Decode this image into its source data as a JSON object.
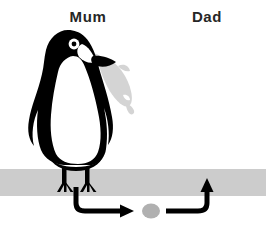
{
  "diagram": {
    "title_visible": false,
    "background_color": "#ffffff",
    "labels": [
      {
        "id": "mum",
        "text": "Mum",
        "x": 88,
        "y": 22,
        "color": "#262626"
      },
      {
        "id": "dad",
        "text": "Dad",
        "x": 207,
        "y": 22,
        "color": "#262626"
      }
    ],
    "ground": {
      "name": "ground-bar",
      "color": "#cccccc",
      "x": 0,
      "y": 169,
      "width": 266,
      "height": 27
    },
    "penguins": [
      {
        "id": "mum-penguin",
        "role": "Mum",
        "facing": "right",
        "body_color": "#000000",
        "belly_color": "#ffffff",
        "eye_color": "#ffffff",
        "holds_item": "fish"
      },
      {
        "id": "dad-penguin",
        "role": "Dad",
        "facing": "left",
        "body_color": "#000000",
        "belly_color": "#ffffff",
        "eye_color": "#ffffff",
        "holds_item": null
      }
    ],
    "fish": {
      "name": "fish",
      "color": "#d4d4d4",
      "held_by": "Mum",
      "description": "fish in beak"
    },
    "egg": {
      "name": "egg",
      "color": "#b0b0b0",
      "cx": 151,
      "cy": 211,
      "rx": 9,
      "ry": 7.5
    },
    "arrows": [
      {
        "id": "arrow-mum-to-egg",
        "name": "arrow-mum-to-egg",
        "from": "Mum feet",
        "to": "egg",
        "color": "#000000",
        "direction": "right",
        "stroke_width": 5
      },
      {
        "id": "arrow-egg-to-dad",
        "name": "arrow-egg-to-dad",
        "from": "egg",
        "to": "Dad feet",
        "color": "#000000",
        "direction": "up",
        "stroke_width": 5
      }
    ]
  }
}
